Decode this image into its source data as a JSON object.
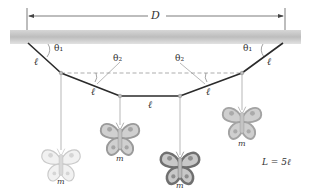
{
  "figure": {
    "dimension_label": "D",
    "segment_label": "ℓ",
    "angle_outer_label": "θ1",
    "angle_inner_label": "θ2",
    "mass_label": "m",
    "length_relation": "L = 5ℓ"
  },
  "labels": {
    "D": "D",
    "theta1_left": "θ₁",
    "theta1_right": "θ₁",
    "theta2_left": "θ₂",
    "theta2_right": "θ₂",
    "ell_1": "ℓ",
    "ell_2": "ℓ",
    "ell_3": "ℓ",
    "ell_4": "ℓ",
    "ell_5": "ℓ",
    "m_1": "m",
    "m_2": "m",
    "m_3": "m",
    "m_4": "m",
    "relation": "L = 5ℓ"
  },
  "colors": {
    "ceiling": "#c8c8c8",
    "string": "#2b2b2b",
    "dashed": "#8a8a8a",
    "hang_line": "#9a9a9a",
    "butterfly_light": "#e4e4e4",
    "butterfly_mid": "#a9a9a9",
    "butterfly_dark": "#7d7d7d"
  }
}
